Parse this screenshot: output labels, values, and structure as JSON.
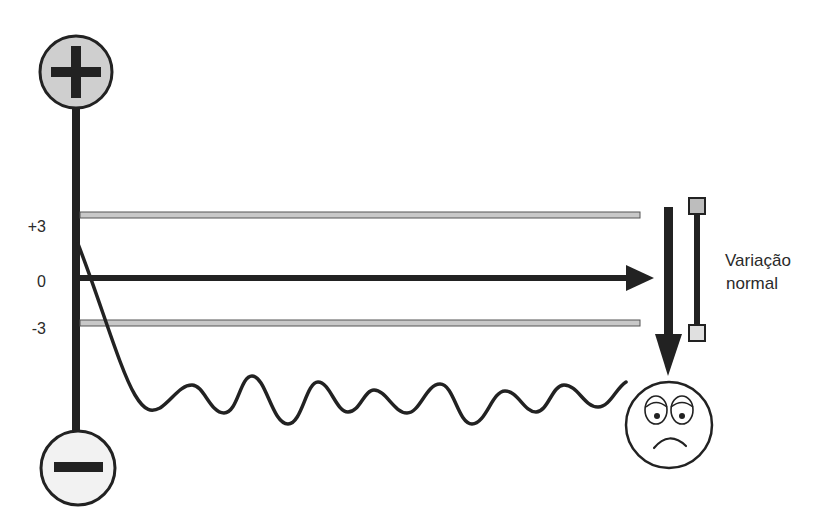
{
  "diagram": {
    "type": "control-chart-illustration",
    "poles": {
      "positive": {
        "symbol": "+",
        "label": "positive-pole"
      },
      "negative": {
        "symbol": "−",
        "label": "negative-pole"
      }
    },
    "axis_labels": {
      "upper_limit": "+3",
      "center": "0",
      "lower_limit": "-3"
    },
    "range_label": {
      "line1": "Variação",
      "line2": "normal"
    },
    "outcome_icon": "sad-face-icon",
    "colors": {
      "ink": "#222222",
      "limit_fill": "#c8c8c8",
      "pole_fill": "#cfcfcf",
      "bracket_fill": "#bdbdbd",
      "background": "#ffffff"
    }
  }
}
